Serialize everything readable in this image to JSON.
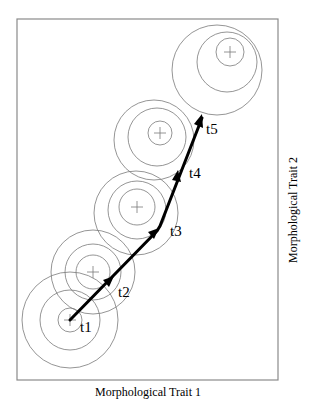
{
  "figure": {
    "x_axis_label": "Morphological Trait 1",
    "y_axis_label": "Morphological Trait 2",
    "time_labels": [
      "t1",
      "t2",
      "t3",
      "t4",
      "t5"
    ],
    "colors": {
      "frame": "#8a8a8a",
      "rings": "#7a7a7a",
      "trajectory": "#000000"
    }
  },
  "groups": [
    {
      "label": "t1",
      "center": [
        70,
        320
      ],
      "rings": [
        {
          "cx": 70,
          "cy": 320,
          "r": 12
        },
        {
          "cx": 70,
          "cy": 320,
          "r": 30
        },
        {
          "cx": 70,
          "cy": 320,
          "r": 48
        }
      ]
    },
    {
      "label": "t2",
      "center": [
        93,
        272
      ],
      "rings": [
        {
          "cx": 93,
          "cy": 272,
          "r": 17
        },
        {
          "cx": 93,
          "cy": 272,
          "r": 28
        },
        {
          "cx": 93,
          "cy": 272,
          "r": 42
        }
      ]
    },
    {
      "label": "t3",
      "center": [
        137,
        207
      ],
      "rings": [
        {
          "cx": 137,
          "cy": 207,
          "r": 18
        },
        {
          "cx": 137,
          "cy": 210,
          "r": 29
        },
        {
          "cx": 136,
          "cy": 213,
          "r": 42
        }
      ]
    },
    {
      "label": "t4",
      "center": [
        160,
        133
      ],
      "rings": [
        {
          "cx": 160,
          "cy": 133,
          "r": 12
        },
        {
          "cx": 157,
          "cy": 137,
          "r": 29
        },
        {
          "cx": 154,
          "cy": 140,
          "r": 40
        }
      ]
    },
    {
      "label": "t5",
      "center": [
        230,
        52
      ],
      "rings": [
        {
          "cx": 230,
          "cy": 52,
          "r": 14
        },
        {
          "cx": 227,
          "cy": 62,
          "r": 30
        },
        {
          "cx": 217,
          "cy": 70,
          "r": 45
        }
      ]
    }
  ]
}
